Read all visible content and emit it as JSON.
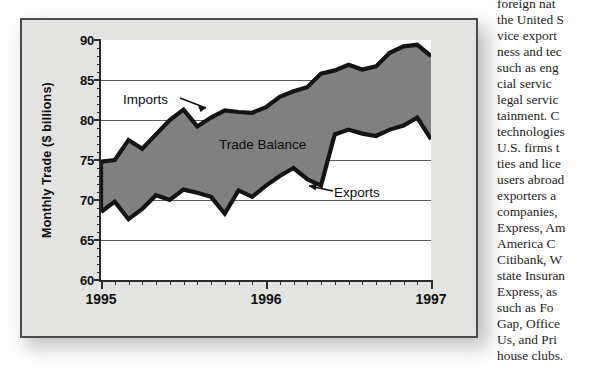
{
  "figure": {
    "yaxis_title": "Monthly Trade ($ billions)",
    "y_ticks": [
      "90",
      "85",
      "80",
      "75",
      "70",
      "65",
      "60"
    ],
    "y_min": 60,
    "y_max": 90,
    "x_labels": [
      "1995",
      "1996",
      "1997"
    ],
    "series_labels": {
      "imports": "Imports",
      "exports": "Exports",
      "balance": "Trade Balance"
    },
    "colors": {
      "fill": "#808080",
      "line": "#141414",
      "panel": "#e3e3e1",
      "plot": "#ffffff",
      "grid": "#5c5c5c"
    }
  },
  "chart_data": {
    "type": "area",
    "title": "",
    "xlabel": "",
    "ylabel": "Monthly Trade ($ billions)",
    "ylim": [
      60,
      90
    ],
    "grid": true,
    "legend": "inline-annotations",
    "annotations": [
      "Imports",
      "Exports",
      "Trade Balance"
    ],
    "x_tick_labels": [
      "1995",
      "1996",
      "1997"
    ],
    "x": [
      "1995-01",
      "1995-02",
      "1995-03",
      "1995-04",
      "1995-05",
      "1995-06",
      "1995-07",
      "1995-08",
      "1995-09",
      "1995-10",
      "1995-11",
      "1995-12",
      "1996-01",
      "1996-02",
      "1996-03",
      "1996-04",
      "1996-05",
      "1996-06",
      "1996-07",
      "1996-08",
      "1996-09",
      "1996-10",
      "1996-11",
      "1996-12",
      "1997-01"
    ],
    "series": [
      {
        "name": "Imports",
        "values": [
          74.8,
          75.0,
          77.5,
          76.4,
          78.2,
          80.0,
          81.3,
          79.2,
          80.3,
          81.2,
          81.0,
          80.9,
          81.6,
          82.9,
          83.6,
          84.1,
          85.8,
          86.2,
          86.9,
          86.3,
          86.7,
          88.4,
          89.2,
          89.4,
          88.0
        ]
      },
      {
        "name": "Exports",
        "values": [
          68.5,
          69.8,
          67.6,
          68.9,
          70.6,
          70.0,
          71.3,
          70.9,
          70.4,
          68.3,
          71.2,
          70.4,
          71.8,
          73.0,
          74.0,
          72.6,
          71.8,
          78.2,
          78.8,
          78.3,
          78.0,
          78.8,
          79.3,
          80.3,
          77.6
        ]
      }
    ],
    "derived": {
      "name": "Trade Balance",
      "description": "Shaded region between Imports and Exports"
    }
  },
  "body_text": {
    "lines": [
      "foreign  nat",
      "the United S",
      "vice  export",
      "ness and tec",
      "such as eng",
      "cial   servic",
      "legal  servic",
      "tainment.  C",
      "technologies",
      "U.S. firms t",
      "ties and lice",
      "users abroad",
      "exporters  a",
      "companies,",
      "Express, Am",
      "America   C",
      "Citibank, W",
      "state Insuran",
      "Express, as",
      "such  as  Fo",
      "Gap, Office",
      "Us,  and  Pri",
      "house clubs."
    ]
  }
}
